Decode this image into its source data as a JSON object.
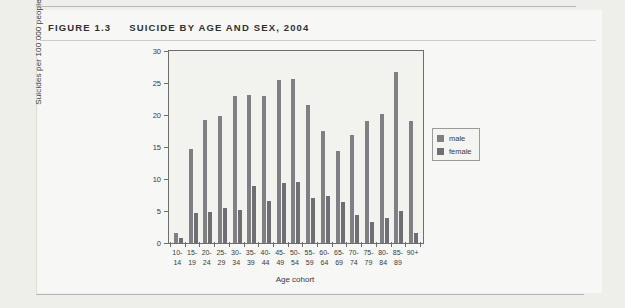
{
  "figure": {
    "number": "FIGURE 1.3",
    "caption": "SUICIDE BY AGE AND SEX, 2004"
  },
  "legend": {
    "male_label": "male",
    "female_label": "female",
    "male_color": "#7f8083",
    "female_color": "#6e6f72",
    "position": "right"
  },
  "chart_data": {
    "type": "bar",
    "title": "SUICIDE BY AGE AND SEX, 2004",
    "xlabel": "Age cohort",
    "ylabel": "Suicides per 100 000 people",
    "ylim": [
      0,
      30
    ],
    "yticks": [
      0,
      5,
      10,
      15,
      20,
      25,
      30
    ],
    "grid": false,
    "legend_position": "right",
    "categories": [
      "10-\n14",
      "15-\n19",
      "20-\n24",
      "25-\n29",
      "30-\n34",
      "35-\n39",
      "40-\n44",
      "45-\n49",
      "50-\n54",
      "55-\n59",
      "60-\n64",
      "65-\n69",
      "70-\n74",
      "75-\n79",
      "80-\n84",
      "85-\n89",
      "90+"
    ],
    "series": [
      {
        "name": "male",
        "color": "#7f8083",
        "values": [
          1.5,
          14.7,
          19.2,
          19.9,
          22.9,
          23.1,
          23.0,
          25.4,
          25.6,
          21.6,
          17.5,
          14.4,
          16.8,
          19.1,
          20.2,
          26.7,
          19.1
        ]
      },
      {
        "name": "female",
        "color": "#6e6f72",
        "values": [
          0.8,
          4.7,
          4.8,
          5.4,
          5.2,
          8.9,
          6.5,
          9.4,
          9.6,
          7.0,
          7.4,
          6.4,
          4.4,
          3.3,
          3.9,
          5.0,
          1.6
        ]
      }
    ]
  }
}
